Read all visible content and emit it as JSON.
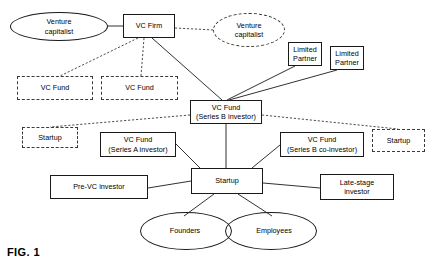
{
  "figure": {
    "label": "FIG. 1"
  },
  "nodes": {
    "venture_capitalist_solid": {
      "label": "Venture\ncapitalist",
      "shape": "ellipse",
      "stroke": "solid"
    },
    "vc_firm": {
      "label": "VC Firm",
      "shape": "rect",
      "stroke": "solid"
    },
    "venture_capitalist_dashed": {
      "label": "Venture\ncapitalist",
      "shape": "ellipse",
      "stroke": "dashed"
    },
    "limited_partner_1": {
      "label": "Limited\nPartner",
      "shape": "rect",
      "stroke": "solid"
    },
    "limited_partner_2": {
      "label": "Limited\nPartner",
      "shape": "rect",
      "stroke": "solid"
    },
    "vc_fund_dashed_1": {
      "label": "VC Fund",
      "shape": "rect",
      "stroke": "dashed"
    },
    "vc_fund_dashed_2": {
      "label": "VC Fund",
      "shape": "rect",
      "stroke": "dashed"
    },
    "vc_fund_series_b": {
      "label": "VC Fund\n(Series B investor)",
      "shape": "rect",
      "stroke": "solid"
    },
    "startup_dashed_left": {
      "label": "Startup",
      "shape": "rect",
      "stroke": "dashed"
    },
    "vc_fund_series_a": {
      "label": "VC Fund\n(Series A investor)",
      "shape": "rect",
      "stroke": "solid"
    },
    "vc_fund_series_b_co": {
      "label": "VC Fund\n(Series B co-investor)",
      "shape": "rect",
      "stroke": "solid"
    },
    "startup_dashed_right": {
      "label": "Startup",
      "shape": "rect",
      "stroke": "dashed"
    },
    "pre_vc_investor": {
      "label": "Pre-VC investor",
      "shape": "rect",
      "stroke": "solid"
    },
    "startup_center": {
      "label": "Startup",
      "shape": "rect",
      "stroke": "solid"
    },
    "late_stage_investor": {
      "label": "Late-stage\ninvestor",
      "shape": "rect",
      "stroke": "solid"
    },
    "founders": {
      "label": "Founders",
      "shape": "ellipse",
      "stroke": "solid"
    },
    "employees": {
      "label": "Employees",
      "shape": "ellipse",
      "stroke": "solid"
    }
  },
  "colors": {
    "stroke_solid": "#1a1a1a",
    "stroke_dashed": "#3a3a3a",
    "text": "#000000",
    "background": "#ffffff"
  }
}
